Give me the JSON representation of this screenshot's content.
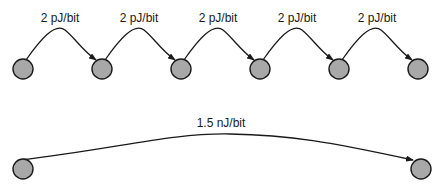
{
  "diagram": {
    "short_hops": {
      "labels": [
        "2 pJ/bit",
        "2 pJ/bit",
        "2 pJ/bit",
        "2 pJ/bit",
        "2 pJ/bit"
      ],
      "node_count": 6
    },
    "long_hop": {
      "label": "1.5 nJ/bit",
      "node_count": 2
    },
    "colors": {
      "node_fill": "#a8a8a8",
      "stroke": "#1a1a1a",
      "background": "#ffffff"
    }
  }
}
